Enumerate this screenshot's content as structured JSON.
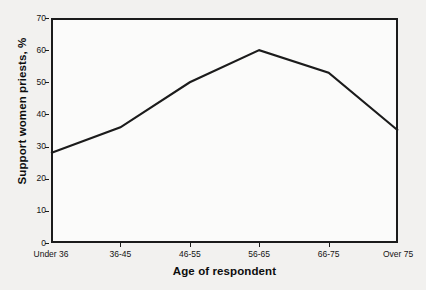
{
  "chart_data": {
    "type": "line",
    "title": "",
    "xlabel": "Age of respondent",
    "ylabel": "Support women priests, %",
    "categories": [
      "Under 36",
      "36-45",
      "46-55",
      "56-65",
      "66-75",
      "Over 75"
    ],
    "values": [
      28,
      36,
      50,
      60,
      53,
      35
    ],
    "series": [
      {
        "name": "Support women priests",
        "values": [
          28,
          36,
          50,
          60,
          53,
          35
        ]
      }
    ],
    "ylim": [
      0,
      70
    ],
    "ytick_labels": [
      "0",
      "10",
      "20",
      "30",
      "40",
      "50",
      "60",
      "70"
    ],
    "ytick_values": [
      0,
      10,
      20,
      30,
      40,
      50,
      60,
      70
    ],
    "xtick_labels": [
      "Under 36",
      "36-45",
      "46-55",
      "56-65",
      "66-75",
      "Over 75"
    ],
    "grid": false,
    "legend": "none",
    "line_color": "#1b1b1b",
    "background_color": "#f2f1ef",
    "plot_background_color": "#fbfbfa"
  },
  "axes": {
    "y_title": "Support women priests, %",
    "x_title": "Age of respondent"
  },
  "ticks": {
    "y": [
      {
        "label": "70",
        "value": 70
      },
      {
        "label": "60",
        "value": 60
      },
      {
        "label": "50",
        "value": 50
      },
      {
        "label": "40",
        "value": 40
      },
      {
        "label": "30",
        "value": 30
      },
      {
        "label": "20",
        "value": 20
      },
      {
        "label": "10",
        "value": 10
      },
      {
        "label": "0",
        "value": 0
      }
    ],
    "x": [
      {
        "label": "Under 36"
      },
      {
        "label": "36-45"
      },
      {
        "label": "46-55"
      },
      {
        "label": "56-65"
      },
      {
        "label": "66-75"
      },
      {
        "label": "Over 75"
      }
    ]
  }
}
